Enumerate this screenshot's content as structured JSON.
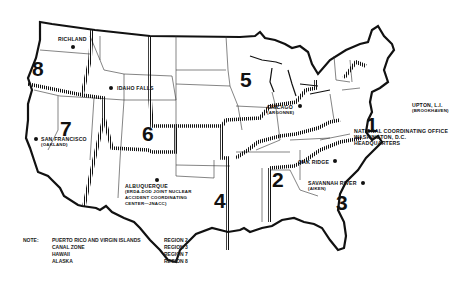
{
  "map": {
    "title": "Regional coordinating offices map of the United States",
    "regions": [
      {
        "number": "1"
      },
      {
        "number": "2"
      },
      {
        "number": "3"
      },
      {
        "number": "4"
      },
      {
        "number": "5"
      },
      {
        "number": "6"
      },
      {
        "number": "7"
      },
      {
        "number": "8"
      }
    ],
    "locations": [
      {
        "name": "RICHLAND",
        "sub": ""
      },
      {
        "name": "IDAHO FALLS",
        "sub": ""
      },
      {
        "name": "SAN FRANCISCO",
        "sub": "(OAKLAND)"
      },
      {
        "name": "ALBUQUERQUE",
        "sub": "(ERDA-DOD JOINT NUCLEAR",
        "sub2": "ACCIDENT COORDINATING",
        "sub3": "CENTER—JNACC)"
      },
      {
        "name": "CHICAGO",
        "sub": "(ARGONNE)"
      },
      {
        "name": "OAK RIDGE",
        "sub": ""
      },
      {
        "name": "SAVANNAH RIVER",
        "sub": "(AIKEN)"
      },
      {
        "name": "UPTON, L.I.",
        "sub": "(BROOKHAVEN)"
      },
      {
        "name": "NATIONAL COORDINATING OFFICE",
        "sub": "WASHINGTON, D.C.",
        "sub2": "HEADQUARTERS"
      }
    ]
  },
  "note": {
    "label": "NOTE:",
    "rows": [
      {
        "area": "PUERTO RICO AND VIRGIN ISLANDS",
        "region": "REGION 2"
      },
      {
        "area": "CANAL ZONE",
        "region": "REGION 3"
      },
      {
        "area": "HAWAII",
        "region": "REGION 7"
      },
      {
        "area": "ALASKA",
        "region": "REGION 8"
      }
    ]
  }
}
